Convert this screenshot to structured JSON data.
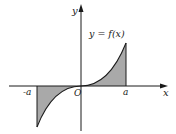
{
  "figure": {
    "type": "diagram",
    "curve_label": "y = f(x)",
    "axis_labels": {
      "x": "x",
      "y": "y"
    },
    "origin_label": "O",
    "tick_labels": {
      "left": "-a",
      "right": "a"
    },
    "colors": {
      "shade": "#a9a9a9",
      "line": "#1a1a1a",
      "background": "#ffffff"
    }
  }
}
